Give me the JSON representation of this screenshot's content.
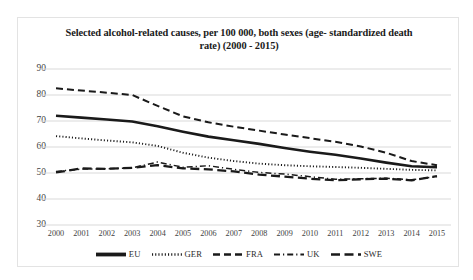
{
  "chart_data": {
    "type": "line",
    "title_line1": "Selected alcohol-related causes, per 100 000, both sexes (age-",
    "title_line2": "standardized death rate) (2000 - 2015)",
    "xlabel": "",
    "ylabel": "",
    "ylim": [
      30,
      90
    ],
    "ytick_step": 10,
    "yticks": [
      90,
      80,
      70,
      60,
      50,
      40,
      30
    ],
    "grid": true,
    "legend_position": "bottom",
    "categories": [
      "2000",
      "2001",
      "2002",
      "2003",
      "2004",
      "2005",
      "2006",
      "2007",
      "2008",
      "2009",
      "2010",
      "2011",
      "2012",
      "2013",
      "2014",
      "2015"
    ],
    "series": [
      {
        "name": "EU",
        "style": "solid",
        "color": "#1a1a1a",
        "values": [
          72.0,
          71.3,
          70.6,
          69.8,
          68.0,
          65.9,
          64.0,
          62.6,
          61.2,
          59.6,
          58.2,
          57.0,
          55.6,
          54.0,
          52.6,
          52.2
        ]
      },
      {
        "name": "GER",
        "style": "dotted",
        "color": "#1a1a1a",
        "values": [
          64.2,
          63.3,
          62.5,
          61.8,
          60.4,
          57.8,
          55.9,
          54.6,
          53.6,
          53.0,
          52.6,
          52.3,
          52.0,
          51.6,
          51.2,
          51.0
        ]
      },
      {
        "name": "FRA",
        "style": "dashed",
        "color": "#1a1a1a",
        "values": [
          82.6,
          81.7,
          80.9,
          80.0,
          75.8,
          71.8,
          69.5,
          67.8,
          66.3,
          64.8,
          63.4,
          62.0,
          60.2,
          57.8,
          54.6,
          53.0
        ]
      },
      {
        "name": "UK",
        "style": "dashdot",
        "color": "#1a1a1a",
        "values": [
          50.6,
          51.5,
          51.6,
          52.0,
          54.2,
          52.2,
          52.8,
          51.4,
          50.2,
          49.6,
          48.6,
          47.6,
          47.8,
          48.0,
          47.4,
          48.6
        ]
      },
      {
        "name": "SWE",
        "style": "longdash",
        "color": "#1a1a1a",
        "values": [
          50.2,
          51.8,
          51.6,
          52.0,
          53.0,
          51.8,
          51.4,
          50.6,
          49.4,
          48.6,
          47.8,
          47.2,
          47.6,
          47.8,
          47.2,
          48.8
        ]
      }
    ]
  },
  "legend": {
    "items": [
      {
        "label": "EU",
        "style": "solid"
      },
      {
        "label": "GER",
        "style": "dotted"
      },
      {
        "label": "FRA",
        "style": "dashed"
      },
      {
        "label": "UK",
        "style": "dashdot"
      },
      {
        "label": "SWE",
        "style": "longdash"
      }
    ]
  }
}
